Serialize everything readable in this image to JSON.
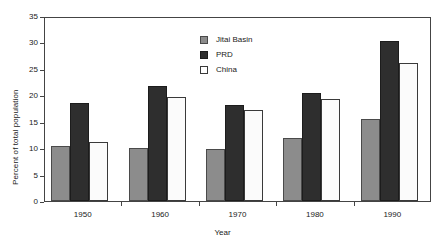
{
  "chart_data": {
    "type": "bar",
    "title": "",
    "subtitle": "",
    "xlabel": "Year",
    "ylabel": "Percent of total population",
    "categories": [
      "1950",
      "1960",
      "1970",
      "1980",
      "1990"
    ],
    "series": [
      {
        "name": "Jitai Basin",
        "color": "#8c8c8c",
        "values": [
          10.4,
          10.0,
          9.9,
          12.0,
          15.5
        ]
      },
      {
        "name": "PRD",
        "color": "#2e2e2e",
        "values": [
          18.5,
          21.8,
          18.2,
          20.4,
          30.3
        ]
      },
      {
        "name": "China",
        "color": "#ffffff",
        "values": [
          11.2,
          19.6,
          17.3,
          19.3,
          26.2
        ]
      }
    ],
    "ylim": [
      0,
      35
    ],
    "yticks": [
      0,
      5,
      10,
      15,
      20,
      25,
      30,
      35
    ],
    "ytick_labels": [
      "0",
      "5",
      "10",
      "15",
      "20",
      "25",
      "30",
      "35"
    ],
    "grid": false,
    "legend_position": "upper-center",
    "axis_color": "#444444",
    "background_color": "#ffffff"
  },
  "legend": {
    "entries": [
      {
        "label": "Jitai Basin",
        "swatch": "jitai"
      },
      {
        "label": "PRD",
        "swatch": "prd"
      },
      {
        "label": "China",
        "swatch": "china"
      }
    ]
  }
}
